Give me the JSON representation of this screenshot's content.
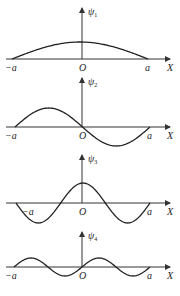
{
  "chart_data": {
    "type": "line",
    "panels": [
      {
        "ylabel": "ψ",
        "subscript": "1",
        "n": 1,
        "xlabel": "X",
        "tick_left": "−a",
        "tick_origin": "O",
        "tick_right": "a",
        "xlim": [
          -1,
          1
        ]
      },
      {
        "ylabel": "ψ",
        "subscript": "2",
        "n": 2,
        "xlabel": "X",
        "tick_left": "−a",
        "tick_origin": "O",
        "tick_right": "a",
        "xlim": [
          -1,
          1
        ]
      },
      {
        "ylabel": "ψ",
        "subscript": "3",
        "n": 3,
        "xlabel": "X",
        "tick_left": "−a",
        "tick_origin": "O",
        "tick_right": "a",
        "xlim": [
          -1,
          1
        ]
      },
      {
        "ylabel": "ψ",
        "subscript": "4",
        "n": 4,
        "xlabel": "X",
        "tick_left": "−a",
        "tick_origin": "O",
        "tick_right": "a",
        "xlim": [
          -1,
          1
        ]
      }
    ]
  }
}
